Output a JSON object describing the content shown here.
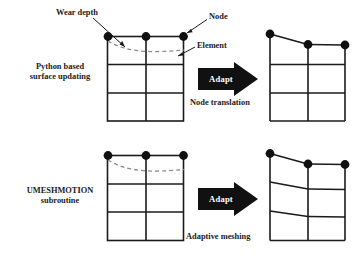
{
  "figure": {
    "background_color": "#ffffff",
    "line_color": "#1b1b1b",
    "node_color": "#101010",
    "wear_curve_color": "#8c8c8c",
    "arrow_color": "#111111",
    "arrow_text_color": "#ffffff"
  },
  "annotations": {
    "wear_depth": "Wear depth",
    "node": "Node",
    "element": "Element"
  },
  "rows": [
    {
      "id": "node-translation",
      "method_label_line1": "Python based",
      "method_label_line2": "surface updating",
      "arrow_label": "Adapt",
      "result_caption": "Node translation",
      "before": {
        "columns": 2,
        "rows": 3,
        "node_count": 3,
        "wear_curve": "dashed",
        "top_edge": "flat"
      },
      "after": {
        "columns": 2,
        "rows": 3,
        "node_count": 3,
        "top_edge": "sloped",
        "interior_rows": "horizontal"
      }
    },
    {
      "id": "adaptive-meshing",
      "method_label_line1": "UMESHMOTION",
      "method_label_line2": "subroutine",
      "arrow_label": "Adapt",
      "result_caption": "Adaptive meshing",
      "before": {
        "columns": 2,
        "rows": 3,
        "node_count": 3,
        "wear_curve": "dashed",
        "top_edge": "flat"
      },
      "after": {
        "columns": 2,
        "rows": 3,
        "node_count": 3,
        "top_edge": "sloped",
        "interior_rows": "sloped"
      }
    }
  ]
}
